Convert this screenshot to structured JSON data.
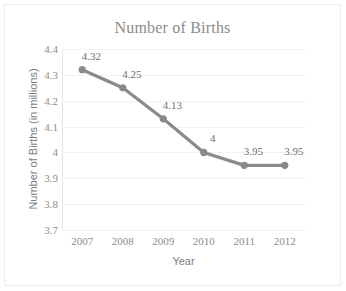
{
  "chart_data": {
    "type": "line",
    "title": "Number of Births",
    "xlabel": "Year",
    "ylabel": "Number of Births (in millions)",
    "categories": [
      "2007",
      "2008",
      "2009",
      "2010",
      "2011",
      "2012"
    ],
    "values": [
      4.32,
      4.25,
      4.13,
      4,
      3.95,
      3.95
    ],
    "point_labels": [
      "4.32",
      "4.25",
      "4.13",
      "4",
      "3.95",
      "3.95"
    ],
    "ylim": [
      3.7,
      4.4
    ],
    "ytick_labels": [
      "4.4",
      "4.3",
      "4.2",
      "4.1",
      "4",
      "3.9",
      "3.8",
      "3.7"
    ],
    "ytick_values": [
      4.4,
      4.3,
      4.2,
      4.1,
      4.0,
      3.9,
      3.8,
      3.7
    ],
    "grid": true,
    "legend": "none",
    "series_color": "#8a8a8a",
    "text_color": "#8c8c8c",
    "grid_color": "#f2f2f2",
    "border_color": "#ececec"
  }
}
